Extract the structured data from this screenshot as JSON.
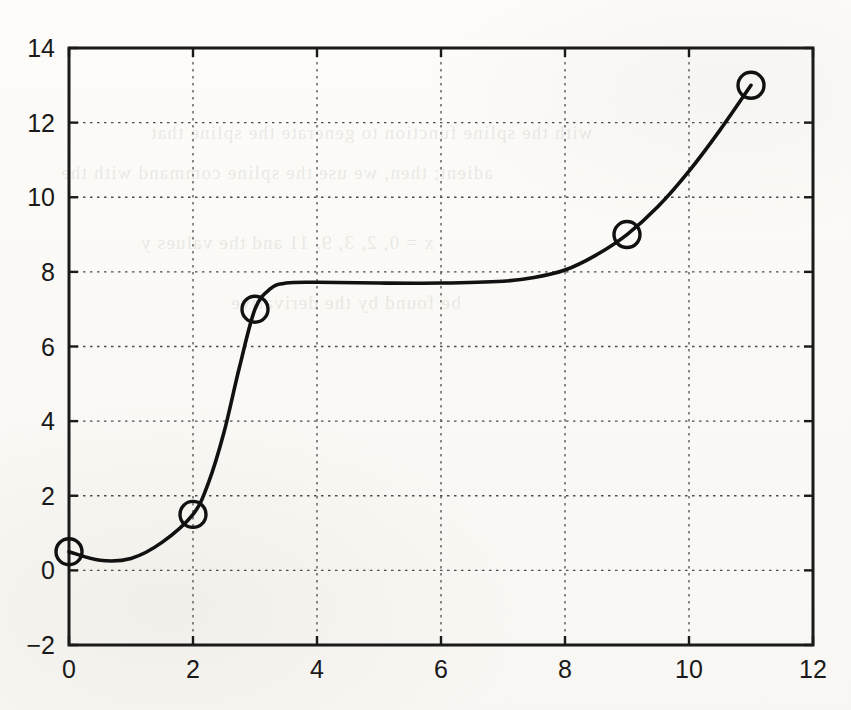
{
  "figure": {
    "background_color": "#fbfaf7",
    "plot_box": {
      "left": 69,
      "top": 48,
      "right": 813,
      "bottom": 645
    },
    "axis_color": "#1a1a1a",
    "grid_color": "#4d4d4d",
    "curve_color": "#111111",
    "marker_color": "#111111"
  },
  "ghost_lines": [
    {
      "x": 150,
      "y": 112,
      "text": "with the spline function to generate the spline that"
    },
    {
      "x": 60,
      "y": 152,
      "text": "adient; then, we use the spline command with the"
    },
    {
      "x": 140,
      "y": 222,
      "text": "x = 0, 2, 3, 9, 11 and the values y"
    },
    {
      "x": 230,
      "y": 282,
      "text": "be found by the derivative"
    }
  ],
  "axes": {
    "x_ticks": [
      "0",
      "2",
      "4",
      "6",
      "8",
      "10",
      "12"
    ],
    "y_ticks": [
      "14",
      "12",
      "10",
      "8",
      "6",
      "4",
      "2",
      "0",
      "−2"
    ],
    "x_tick_values": [
      0,
      2,
      4,
      6,
      8,
      10,
      12
    ],
    "y_tick_values": [
      14,
      12,
      10,
      8,
      6,
      4,
      2,
      0,
      -2
    ]
  },
  "chart_data": {
    "type": "line",
    "title": "",
    "subtitle": "",
    "xlabel": "",
    "ylabel": "",
    "xlim": [
      0,
      12
    ],
    "ylim": [
      -2,
      14
    ],
    "xticks": [
      0,
      2,
      4,
      6,
      8,
      10,
      12
    ],
    "yticks": [
      -2,
      0,
      2,
      4,
      6,
      8,
      10,
      12,
      14
    ],
    "grid": true,
    "grid_style": "dotted",
    "legend": null,
    "legend_position": "none",
    "annotations": [],
    "series": [
      {
        "name": "spline interpolant",
        "style": "solid line, black, 2.5px, smooth cubic spline",
        "comment": "continuous interpolating curve through the data points, with a flat plateau near y=7.7 between x=3.5 and x=7.5",
        "x": [
          0,
          0.5,
          1,
          1.5,
          2,
          2.25,
          2.5,
          2.75,
          3,
          3.25,
          3.5,
          4,
          5,
          6,
          7,
          7.5,
          8,
          8.5,
          9,
          9.5,
          10,
          10.5,
          11
        ],
        "y": [
          0.5,
          0.27,
          0.32,
          0.75,
          1.5,
          2.35,
          3.7,
          5.45,
          7.0,
          7.55,
          7.7,
          7.72,
          7.7,
          7.7,
          7.75,
          7.85,
          8.05,
          8.45,
          9.0,
          9.75,
          10.7,
          11.8,
          13.0
        ]
      },
      {
        "name": "data points",
        "style": "open circle markers, black edge, no fill, radius 13px",
        "marker": "o",
        "x": [
          0,
          2,
          3,
          9,
          11
        ],
        "y": [
          0.5,
          1.5,
          7.0,
          9.0,
          13.0
        ]
      }
    ]
  }
}
